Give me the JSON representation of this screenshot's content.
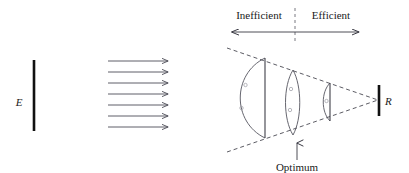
{
  "figure": {
    "background_color": "#ffffff",
    "ink_color": "#1a1a1a"
  },
  "source": {
    "label": "E",
    "name": "emitter-bar",
    "bar": {
      "x": 34,
      "y_top": 60,
      "y_bottom": 131,
      "width": 2.6
    },
    "label_pos": {
      "x": 19,
      "y": 102
    }
  },
  "receiver": {
    "label": "R",
    "name": "receiver-bar",
    "bar": {
      "x": 379,
      "y_top": 85,
      "y_bottom": 116,
      "width": 2.6
    },
    "label_pos": {
      "x": 386,
      "y": 104
    }
  },
  "rays": {
    "name": "parallel-ray-bundle",
    "count": 7,
    "x_start": 108,
    "x_end": 172,
    "y_values": [
      61,
      72,
      83,
      94,
      105,
      116,
      127
    ],
    "direction": "right"
  },
  "zones": {
    "inefficient": {
      "label": "Inefficient",
      "text_pos": {
        "x": 259,
        "y": 19
      }
    },
    "efficient": {
      "label": "Efficient",
      "text_pos": {
        "x": 330,
        "y": 19
      }
    },
    "divider": {
      "x": 295,
      "y_top": 8,
      "y_bottom": 43
    },
    "axis_arrow": {
      "x_left": 227,
      "x_right": 364,
      "y": 32
    }
  },
  "optimum": {
    "label": "Optimum",
    "text_pos": {
      "x": 297,
      "y": 168
    },
    "arrow": {
      "x": 297,
      "y_tail": 160,
      "y_head": 139
    }
  },
  "cone": {
    "name": "convergence-cone",
    "apex": {
      "x": 378,
      "y": 100
    },
    "upper_start": {
      "x": 227,
      "y": 48
    },
    "lower_start": {
      "x": 227,
      "y": 152
    }
  },
  "lenses": [
    {
      "name": "lens-inefficient-large",
      "type": "plano-convex",
      "flat_x": 265,
      "y_top": 58,
      "y_bottom": 138,
      "bulge": 35,
      "marks": 2
    },
    {
      "name": "lens-optimum-middle",
      "type": "biconvex",
      "center_x": 293,
      "y_top": 70,
      "y_bottom": 135,
      "bulge": 9,
      "marks": 2
    },
    {
      "name": "lens-efficient-small",
      "type": "plano-convex",
      "flat_x": 330,
      "y_top": 83,
      "y_bottom": 121,
      "bulge": 10,
      "marks": 1
    }
  ]
}
